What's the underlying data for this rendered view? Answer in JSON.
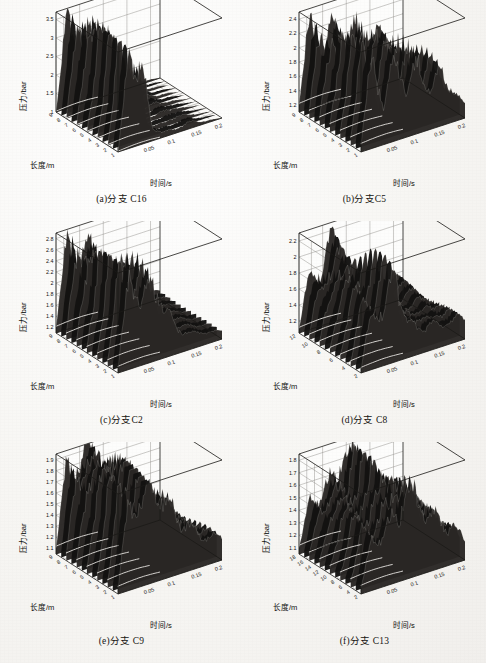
{
  "page": {
    "width": 486,
    "height": 663,
    "background_color": "#fbfaf8",
    "ink_color": "#141210",
    "surface_color": "#131211",
    "ridge_color": "#f2f0ec"
  },
  "axis_titles": {
    "pressure": "压力/bar",
    "length": "长度/m",
    "time": "时间/s"
  },
  "chart_data": [
    {
      "id": "panel-a",
      "type": "surface",
      "title": "(a)分支 C16",
      "branch": "C16",
      "xlabel": "时间/s",
      "ylabel": "长度/m",
      "zlabel": "压力/bar",
      "x_ticks": [
        0.05,
        0.1,
        0.15,
        0.2
      ],
      "x_tick_labels": [
        "0.05",
        "0.1",
        "0.15",
        "0.2"
      ],
      "y_ticks": [
        1,
        2,
        3,
        4,
        5,
        6,
        7,
        8,
        9
      ],
      "y_tick_labels": [
        "1",
        "2",
        "3",
        "4",
        "5",
        "6",
        "7",
        "8",
        "9"
      ],
      "z_ticks": [
        1,
        1.5,
        2,
        2.5,
        3,
        3.5
      ],
      "z_tick_labels": [
        "1",
        "1.5",
        "2",
        "2.5",
        "3",
        "3.5"
      ],
      "xlim": [
        0,
        0.22
      ],
      "ylim": [
        1,
        9
      ],
      "zlim": [
        1,
        3.7
      ],
      "grid": true,
      "description": "单一高压峰在t≈0.02-0.06s沿全长升至约3.5bar后迅速衰减至基线1bar",
      "peak_pressure": 3.5,
      "baseline_pressure": 1.0,
      "peak_time": 0.04,
      "profile_z": [
        1.0,
        3.5,
        3.2,
        1.3,
        1.15,
        1.1,
        1.2,
        1.1,
        1.05,
        1.0
      ]
    },
    {
      "id": "panel-b",
      "type": "surface",
      "title": "(b)分支C5",
      "branch": "C5",
      "xlabel": "时间/s",
      "ylabel": "长度/m",
      "zlabel": "压力/bar",
      "x_ticks": [
        0.05,
        0.1,
        0.15,
        0.2
      ],
      "x_tick_labels": [
        "0.05",
        "0.1",
        "0.15",
        "0.2"
      ],
      "y_ticks": [
        1,
        2,
        3,
        4,
        5,
        6,
        7,
        8,
        9
      ],
      "y_tick_labels": [
        "1",
        "2",
        "3",
        "4",
        "5",
        "6",
        "7",
        "8",
        "9"
      ],
      "z_ticks": [
        1.2,
        1.4,
        1.6,
        1.8,
        2.0,
        2.2,
        2.4
      ],
      "z_tick_labels": [
        "1.2",
        "1.4",
        "1.6",
        "1.8",
        "2",
        "2.2",
        "2.4"
      ],
      "xlim": [
        0,
        0.22
      ],
      "ylim": [
        1,
        9
      ],
      "zlim": [
        1.1,
        2.5
      ],
      "grid": true,
      "description": "多个周期性压力波峰，峰值约2.4bar，振荡持续整个时间段",
      "peak_pressure": 2.4,
      "baseline_pressure": 1.2,
      "peak_time": 0.05,
      "profile_z": [
        1.2,
        2.4,
        1.6,
        2.3,
        1.7,
        2.1,
        1.6,
        1.9,
        1.5,
        1.3
      ]
    },
    {
      "id": "panel-c",
      "type": "surface",
      "title": "(c)分支C2",
      "branch": "C2",
      "xlabel": "时间/s",
      "ylabel": "长度/m",
      "zlabel": "压力/bar",
      "x_ticks": [
        0.05,
        0.1,
        0.15,
        0.2
      ],
      "x_tick_labels": [
        "0.05",
        "0.1",
        "0.15",
        "0.2"
      ],
      "y_ticks": [
        1,
        2,
        3,
        4,
        5,
        6,
        7,
        8,
        9
      ],
      "y_tick_labels": [
        "1",
        "2",
        "3",
        "4",
        "5",
        "6",
        "7",
        "8",
        "9"
      ],
      "z_ticks": [
        1.2,
        1.4,
        1.6,
        1.8,
        2.0,
        2.2,
        2.4,
        2.6,
        2.8
      ],
      "z_tick_labels": [
        "1.2",
        "1.4",
        "1.6",
        "1.8",
        "2",
        "2.2",
        "2.4",
        "2.6",
        "2.8"
      ],
      "xlim": [
        0,
        0.22
      ],
      "ylim": [
        1,
        9
      ],
      "zlim": [
        1.1,
        2.9
      ],
      "grid": true,
      "description": "两个主要压力台阶，峰值约2.8bar，后期衰减至1.3bar",
      "peak_pressure": 2.8,
      "baseline_pressure": 1.2,
      "peak_time": 0.045,
      "profile_z": [
        1.2,
        2.8,
        2.2,
        2.6,
        2.0,
        1.6,
        1.4,
        1.35,
        1.3,
        1.25
      ]
    },
    {
      "id": "panel-d",
      "type": "surface",
      "title": "(d)分支 C8",
      "branch": "C8",
      "xlabel": "时间/s",
      "ylabel": "长度/m",
      "zlabel": "压力/bar",
      "x_ticks": [
        0.05,
        0.1,
        0.15,
        0.2
      ],
      "x_tick_labels": [
        "0.05",
        "0.1",
        "0.15",
        "0.2"
      ],
      "y_ticks": [
        2,
        4,
        6,
        8,
        10,
        12
      ],
      "y_tick_labels": [
        "2",
        "4",
        "6",
        "8",
        "10",
        "12"
      ],
      "z_ticks": [
        1.2,
        1.4,
        1.6,
        1.8,
        2.0,
        2.2
      ],
      "z_tick_labels": [
        "1.2",
        "1.4",
        "1.6",
        "1.8",
        "2",
        "2.2"
      ],
      "xlim": [
        0,
        0.22
      ],
      "ylim": [
        2,
        12
      ],
      "zlim": [
        1.05,
        2.3
      ],
      "grid": true,
      "description": "压力在t≈0.06-0.1s升至约2.1bar，随后出现衰减振荡",
      "peak_pressure": 2.1,
      "baseline_pressure": 1.1,
      "peak_time": 0.09,
      "profile_z": [
        1.1,
        1.8,
        1.75,
        2.1,
        1.5,
        1.35,
        1.4,
        1.3,
        1.35,
        1.3
      ]
    },
    {
      "id": "panel-e",
      "type": "surface",
      "title": "(e)分支 C9",
      "branch": "C9",
      "xlabel": "时间/s",
      "ylabel": "长度/m",
      "zlabel": "压力/bar",
      "x_ticks": [
        0.05,
        0.1,
        0.15,
        0.2
      ],
      "x_tick_labels": [
        "0.05",
        "0.1",
        "0.15",
        "0.2"
      ],
      "y_ticks": [
        1,
        2,
        3,
        4,
        5,
        6,
        7,
        8,
        9
      ],
      "y_tick_labels": [
        "1",
        "2",
        "3",
        "4",
        "5",
        "6",
        "7",
        "8",
        "9"
      ],
      "z_ticks": [
        1.1,
        1.2,
        1.3,
        1.4,
        1.5,
        1.6,
        1.7,
        1.8,
        1.9
      ],
      "z_tick_labels": [
        "1.1",
        "1.2",
        "1.3",
        "1.4",
        "1.5",
        "1.6",
        "1.7",
        "1.8",
        "1.9"
      ],
      "xlim": [
        0,
        0.22
      ],
      "ylim": [
        1,
        9
      ],
      "zlim": [
        1.05,
        1.95
      ],
      "grid": true,
      "description": "压力在约1.8bar形成宽平台，后期缓慢下降并伴随小幅波动",
      "peak_pressure": 1.9,
      "baseline_pressure": 1.1,
      "peak_time": 0.06,
      "profile_z": [
        1.1,
        1.85,
        1.8,
        1.9,
        1.75,
        1.6,
        1.45,
        1.35,
        1.3,
        1.25
      ]
    },
    {
      "id": "panel-f",
      "type": "surface",
      "title": "(f)分支 C13",
      "branch": "C13",
      "xlabel": "时间/s",
      "ylabel": "长度/m",
      "zlabel": "压力/bar",
      "x_ticks": [
        0.05,
        0.1,
        0.15,
        0.2
      ],
      "x_tick_labels": [
        "0.05",
        "0.1",
        "0.15",
        "0.2"
      ],
      "y_ticks": [
        2,
        4,
        6,
        8,
        10,
        12,
        14,
        16,
        18
      ],
      "y_tick_labels": [
        "2",
        "4",
        "6",
        "8",
        "10",
        "12",
        "14",
        "16",
        "18"
      ],
      "z_ticks": [
        1.1,
        1.2,
        1.3,
        1.4,
        1.5,
        1.6,
        1.7,
        1.8
      ],
      "z_tick_labels": [
        "1.1",
        "1.2",
        "1.3",
        "1.4",
        "1.5",
        "1.6",
        "1.7",
        "1.8"
      ],
      "xlim": [
        0,
        0.22
      ],
      "ylim": [
        2,
        18
      ],
      "zlim": [
        1.05,
        1.85
      ],
      "grid": true,
      "description": "中段压力台阶约1.5bar，t≈0.12s出现最高峰约1.8bar后衰减",
      "peak_pressure": 1.8,
      "baseline_pressure": 1.1,
      "peak_time": 0.12,
      "profile_z": [
        1.1,
        1.45,
        1.5,
        1.55,
        1.8,
        1.6,
        1.5,
        1.4,
        1.35,
        1.2
      ]
    }
  ]
}
